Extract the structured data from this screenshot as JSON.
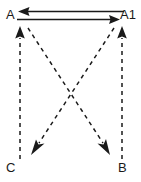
{
  "diagram": {
    "background_color": "#ffffff",
    "stroke_color": "#1a1a1a",
    "nodes": [
      {
        "id": "A",
        "label": "A",
        "position": "top-left",
        "x": 20,
        "y": 14
      },
      {
        "id": "A1",
        "label": "A1",
        "position": "top-right",
        "x": 122,
        "y": 14
      },
      {
        "id": "C",
        "label": "C",
        "position": "bottom-left",
        "x": 20,
        "y": 167
      },
      {
        "id": "B",
        "label": "B",
        "position": "bottom-right",
        "x": 122,
        "y": 167
      }
    ],
    "edges": [
      {
        "name": "edge-a1-to-a",
        "from": "A1",
        "to": "A",
        "style": "solid",
        "direction": "leftward",
        "arrowhead": "filled-triangle",
        "x1": 122,
        "y1": 11,
        "x2": 20,
        "y2": 11
      },
      {
        "name": "edge-a-to-a1",
        "from": "A",
        "to": "A1",
        "style": "solid",
        "direction": "rightward",
        "arrowhead": "filled-triangle",
        "x1": 20,
        "y1": 19,
        "x2": 122,
        "y2": 19
      },
      {
        "name": "edge-c-to-a",
        "from": "C",
        "to": "A",
        "style": "dashed",
        "direction": "upward",
        "arrowhead": "filled-triangle",
        "x1": 20,
        "y1": 158,
        "x2": 20,
        "y2": 27
      },
      {
        "name": "edge-b-to-a1",
        "from": "B",
        "to": "A1",
        "style": "dashed",
        "direction": "upward",
        "arrowhead": "filled-triangle",
        "x1": 122,
        "y1": 158,
        "x2": 122,
        "y2": 27
      },
      {
        "name": "edge-a-to-b",
        "from": "A",
        "to": "B",
        "style": "dashed",
        "direction": "down-right",
        "arrowhead": "filled-triangle",
        "x1": 26,
        "y1": 27,
        "x2": 110,
        "y2": 155
      },
      {
        "name": "edge-a1-to-c",
        "from": "A1",
        "to": "C",
        "style": "dashed",
        "direction": "down-left",
        "arrowhead": "filled-triangle",
        "x1": 116,
        "y1": 27,
        "x2": 32,
        "y2": 155
      }
    ]
  }
}
